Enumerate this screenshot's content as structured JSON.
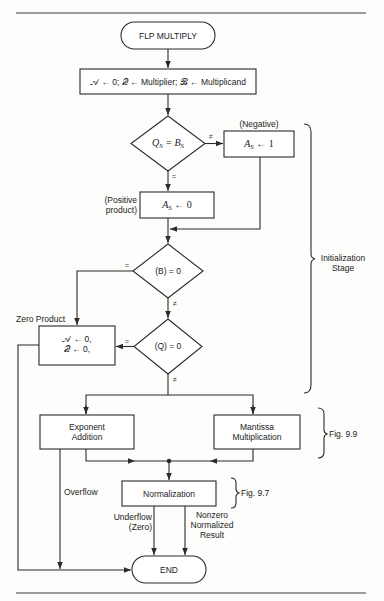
{
  "diagram": {
    "type": "flowchart",
    "title": "FLP MULTIPLY",
    "nodes": {
      "start": {
        "label": "FLP MULTIPLY",
        "shape": "terminal"
      },
      "init": {
        "label": "𝒜 ← 0; 𝒬 ← Multiplier; ℬ ← Multiplicand",
        "shape": "process"
      },
      "sign_test": {
        "label_left": "Q",
        "label_left_sub": "S",
        "label_op": " = ",
        "label_right": "B",
        "label_right_sub": "S",
        "shape": "decision"
      },
      "neg_box": {
        "label": "A",
        "label_sub": "S",
        "label_rest": " ← 1",
        "shape": "process",
        "annotation": "(Negative)"
      },
      "pos_box": {
        "label": "A",
        "label_sub": "S",
        "label_rest": " ← 0",
        "shape": "process",
        "annotation_line1": "(Positive",
        "annotation_line2": "product)"
      },
      "b_test": {
        "label": "(B) = 0",
        "shape": "decision"
      },
      "q_test": {
        "label": "(Q) = 0",
        "shape": "decision"
      },
      "zero_box": {
        "line1": "𝒜 ← 0,",
        "line2": "𝒬 ← 0,",
        "shape": "process",
        "annotation": "Zero Product"
      },
      "exponent": {
        "line1": "Exponent",
        "line2": "Addition",
        "shape": "process"
      },
      "mantissa": {
        "line1": "Mantissa",
        "line2": "Multiplication",
        "shape": "process"
      },
      "normalization": {
        "label": "Normalization",
        "shape": "process"
      },
      "end": {
        "label": "END",
        "shape": "terminal"
      }
    },
    "edge_labels": {
      "sign_ne": "≠",
      "sign_eq": "=",
      "b_eq": "=",
      "b_ne": "≠",
      "q_eq": "=",
      "q_ne": "≠",
      "overflow": "Overflow",
      "underflow_line1": "Underflow",
      "underflow_line2": "(Zero)",
      "nonzero_line1": "Nonzero",
      "nonzero_line2": "Normalized",
      "nonzero_line3": "Result"
    },
    "braces": {
      "init_stage_line1": "Initialization",
      "init_stage_line2": "Stage",
      "fig99": "Fig. 9.9",
      "fig97": "Fig. 9.7"
    }
  }
}
